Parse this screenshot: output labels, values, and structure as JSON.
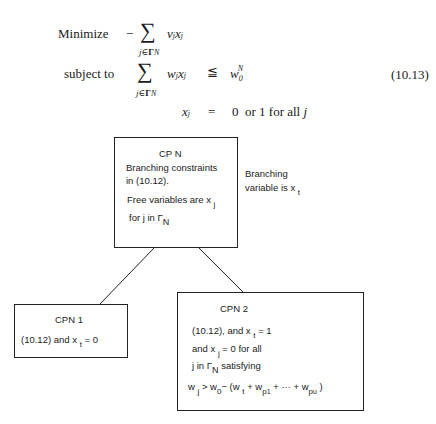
{
  "equation": {
    "number": "(10.13)",
    "objective_label": "Minimize",
    "objective_expr": "− Σ v_j x_j",
    "sum_index": "j∈Γ_N",
    "constraint_label": "subject to",
    "constraint_lhs": "Σ w_j x_j",
    "constraint_rel": "≦",
    "constraint_rhs": "w_0^N",
    "binary_lhs": "x_j",
    "binary_rel": "=",
    "binary_rhs": "0 or 1 for all j"
  },
  "diagram": {
    "root": {
      "title": "CP N",
      "line1": "Branching constraints",
      "line2": "in (10.12).",
      "line3": "Free variables are x",
      "line3_sub": "j",
      "line4": "for j in Γ",
      "line4_sub": "N"
    },
    "branch_note": {
      "line1": "Branching",
      "line2": "variable is x",
      "line2_sub": "t"
    },
    "left_child": {
      "title": "CPN 1",
      "line1_pre": "(10.12) and x",
      "line1_sub": "t",
      "line1_post": " = 0"
    },
    "right_child": {
      "title": "CPN 2",
      "line1_pre": "(10.12), and x",
      "line1_sub": "t",
      "line1_post": " = 1",
      "line2_pre": "and x",
      "line2_sub": "j",
      "line2_post": " = 0 for all",
      "line3_pre": "j in Γ",
      "line3_sub": "N",
      "line3_post": " satisfying",
      "line4": "w_j > w_0 − (w_t + w_p1 + ··· + w_pu)"
    }
  }
}
